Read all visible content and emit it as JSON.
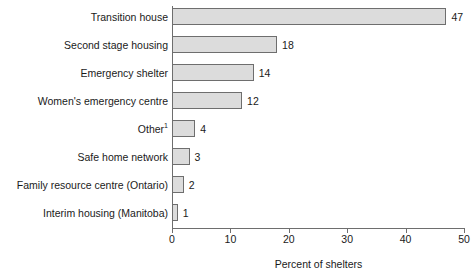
{
  "chart_data": {
    "type": "bar",
    "orientation": "horizontal",
    "title": "",
    "xlabel": "Percent of shelters",
    "ylabel": "",
    "xlim": [
      0,
      50
    ],
    "xticks": [
      0,
      10,
      20,
      30,
      40,
      50
    ],
    "grid": false,
    "legend": null,
    "categories": [
      "Transition house",
      "Second stage housing",
      "Emergency shelter",
      "Women's emergency centre",
      "Other",
      "Safe home network",
      "Family resource centre (Ontario)",
      "Interim housing (Manitoba)"
    ],
    "category_footnotes": [
      "",
      "",
      "",
      "",
      "1",
      "",
      "",
      ""
    ],
    "values": [
      47,
      18,
      14,
      12,
      4,
      3,
      2,
      1
    ],
    "value_labels": [
      "47",
      "18",
      "14",
      "12",
      "4",
      "3",
      "2",
      "1"
    ],
    "colors": {
      "bar_fill": "#dcdcdc",
      "bar_border": "#6e6e6e",
      "axis": "#6e6e6e",
      "text": "#1a1a1a",
      "background": "#ffffff"
    }
  }
}
